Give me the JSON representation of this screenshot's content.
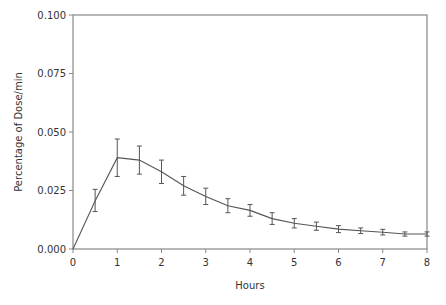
{
  "chart_data": {
    "type": "line",
    "title": "",
    "xlabel": "Hours",
    "ylabel": "Percentage of Dose/min",
    "xlim": [
      0,
      8
    ],
    "ylim": [
      0,
      0.1
    ],
    "x_ticks": [
      "0",
      "1",
      "2",
      "3",
      "4",
      "5",
      "6",
      "7",
      "8"
    ],
    "y_ticks": [
      "0.000",
      "0.025",
      "0.050",
      "0.075",
      "0.100"
    ],
    "grid": false,
    "legend": null,
    "series": [
      {
        "name": "Percentage of Dose/min",
        "x": [
          0,
          0.5,
          1,
          1.5,
          2,
          2.5,
          3,
          3.5,
          4,
          4.5,
          5,
          5.5,
          6,
          6.5,
          7,
          7.5,
          8
        ],
        "values": [
          0.0,
          0.0205,
          0.039,
          0.038,
          0.033,
          0.027,
          0.0225,
          0.0185,
          0.0165,
          0.013,
          0.011,
          0.0097,
          0.0085,
          0.0078,
          0.0072,
          0.0064,
          0.0064
        ],
        "err_low": [
          null,
          0.016,
          0.031,
          0.032,
          0.028,
          0.023,
          0.019,
          0.0155,
          0.014,
          0.0105,
          0.009,
          0.008,
          0.007,
          0.0066,
          0.006,
          0.0055,
          0.0055
        ],
        "err_high": [
          null,
          0.0255,
          0.047,
          0.044,
          0.038,
          0.031,
          0.026,
          0.0215,
          0.019,
          0.0155,
          0.013,
          0.0115,
          0.01,
          0.009,
          0.0084,
          0.0073,
          0.0073
        ]
      }
    ],
    "colors": {
      "line": "#555555",
      "axis": "#888888",
      "text": "#333333"
    }
  }
}
